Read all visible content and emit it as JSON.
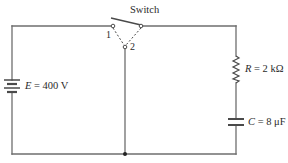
{
  "diagram": {
    "type": "circuit",
    "colors": {
      "wire": "#6e6e6e",
      "text": "#2a2a2a",
      "background": "#ffffff"
    },
    "switch": {
      "label": "Switch",
      "terminal_1": "1",
      "terminal_2": "2"
    },
    "source": {
      "symbol": "E",
      "equals": " = ",
      "value": "400 V"
    },
    "resistor": {
      "symbol": "R",
      "equals": " = ",
      "value": "2 kΩ"
    },
    "capacitor": {
      "symbol": "C",
      "equals": " = ",
      "value": "8 μF"
    }
  }
}
